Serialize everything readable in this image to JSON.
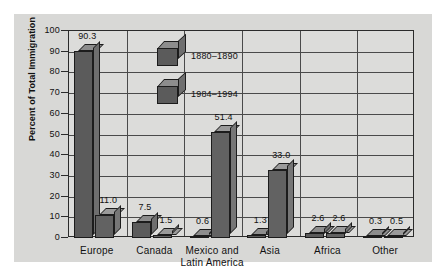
{
  "chart_data": {
    "type": "bar",
    "title": "",
    "xlabel": "",
    "ylabel": "Percent of Total Immigration",
    "ylim": [
      0,
      100
    ],
    "ytick_labels": [
      "100",
      "90",
      "80",
      "70",
      "60",
      "50",
      "40",
      "30",
      "20",
      "10",
      "0"
    ],
    "ytick_values": [
      100,
      90,
      80,
      70,
      60,
      50,
      40,
      30,
      20,
      10,
      0
    ],
    "grid": true,
    "legend_position": "inside-top-left",
    "categories": [
      "Europe",
      "Canada",
      "Mexico and Latin America",
      "Asia",
      "Africa",
      "Other"
    ],
    "category_labels": [
      {
        "line1": "Europe",
        "line2": ""
      },
      {
        "line1": "Canada",
        "line2": ""
      },
      {
        "line1": "Mexico and",
        "line2": "Latin America"
      },
      {
        "line1": "Asia",
        "line2": ""
      },
      {
        "line1": "Africa",
        "line2": ""
      },
      {
        "line1": "Other",
        "line2": ""
      }
    ],
    "series": [
      {
        "name": "1880–1890",
        "values": [
          90.3,
          7.5,
          0.6,
          1.3,
          2.6,
          0.3
        ],
        "value_labels": [
          "90.3",
          "7.5",
          "0.6",
          "1.3",
          "2.6",
          "0.3"
        ],
        "color": "#5b5b5b"
      },
      {
        "name": "1984–1994",
        "values": [
          11.0,
          1.5,
          51.4,
          33.0,
          2.6,
          0.5
        ],
        "value_labels": [
          "11.0",
          "1.5",
          "51.4",
          "33.0",
          "2.6",
          "0.5"
        ],
        "color": "#626262"
      }
    ]
  },
  "legend": {
    "items": [
      {
        "label": "1880–1890"
      },
      {
        "label": "1984–1994"
      }
    ]
  },
  "colors": {
    "figure_background": "#d8d8d6",
    "plot_background": "#dcdcda",
    "axis": "#2b2b2b",
    "grid": "#4a4a4a",
    "bar_front": "#5b5b5b",
    "bar_top": "#8d8d8d",
    "bar_side": "#6e6e6e",
    "text": "#111111"
  }
}
